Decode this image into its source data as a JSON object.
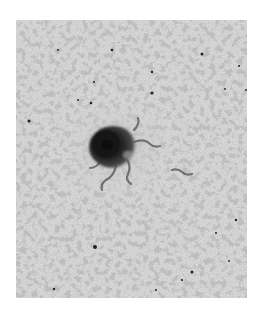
{
  "image": {
    "kind": "electron-micrograph",
    "description": "Grayscale micrograph of a dark central particle surrounded by a spread network of fine fibers",
    "colors": {
      "page_background": "#ffffff",
      "field": "#d9d9d9",
      "fiber": "#6e6e6e",
      "particle_core": "#1e1e1e",
      "particle_edge": "#555555",
      "speck": "#222222"
    },
    "frame": {
      "x": 16,
      "y": 20,
      "width": 231,
      "height": 278
    },
    "particle": {
      "cx": 96,
      "cy": 126,
      "rx": 23,
      "ry": 20
    },
    "specks": [
      [
        42,
        30
      ],
      [
        96,
        30
      ],
      [
        186,
        34
      ],
      [
        223,
        46
      ],
      [
        136,
        52
      ],
      [
        114,
        63
      ],
      [
        78,
        62
      ],
      [
        136,
        73
      ],
      [
        62,
        80
      ],
      [
        13,
        101
      ],
      [
        75,
        83
      ],
      [
        220,
        200
      ],
      [
        79,
        227
      ],
      [
        200,
        213
      ],
      [
        176,
        252
      ],
      [
        38,
        269
      ],
      [
        140,
        270
      ],
      [
        213,
        241
      ],
      [
        230,
        70
      ],
      [
        209,
        69
      ]
    ]
  }
}
